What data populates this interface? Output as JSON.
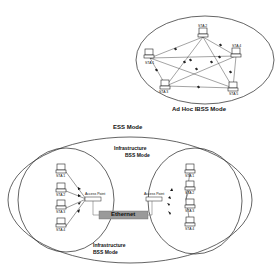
{
  "adhoc": {
    "title": "Ad Hoc IBSS Mode",
    "stations": [
      {
        "label": "STA 1",
        "x": 146,
        "y": 58
      },
      {
        "label": "STA 2",
        "x": 200,
        "y": 35
      },
      {
        "label": "STA 3",
        "x": 162,
        "y": 86
      },
      {
        "label": "STA 4",
        "x": 236,
        "y": 54
      },
      {
        "label": "STA 5",
        "x": 232,
        "y": 88
      }
    ]
  },
  "ess": {
    "title": "ESS Mode",
    "bss_left": {
      "title_line1": "Infrastructure",
      "title_line2": "BSS Mode",
      "access_point": "Access Point",
      "stations": [
        "STA 1",
        "STA 2",
        "STA 3",
        "STA 4"
      ]
    },
    "bss_right": {
      "title_line1": "Infrastructure",
      "title_line2": "BSS Mode",
      "access_point": "Access Point",
      "stations": [
        "STA 1",
        "STA 2",
        "STA 3",
        "STA 4"
      ]
    },
    "backbone": "Ethernet"
  },
  "colors": {
    "line": "#222222",
    "ethernet_fill": "#9a9a9a",
    "background": "#ffffff"
  }
}
